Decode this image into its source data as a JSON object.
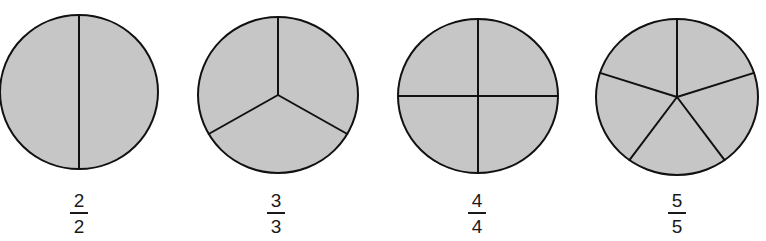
{
  "figure": {
    "colors": {
      "fill": "#c6c6c6",
      "stroke": "#111111",
      "background": "#ffffff"
    },
    "circles": [
      {
        "parts": 2,
        "cx": 79,
        "cy": 92,
        "rx": 79,
        "ry": 77,
        "fraction": {
          "numerator": "2",
          "denominator": "2"
        }
      },
      {
        "parts": 3,
        "cx": 278,
        "cy": 95,
        "rx": 80,
        "ry": 78,
        "fraction": {
          "numerator": "3",
          "denominator": "3"
        }
      },
      {
        "parts": 4,
        "cx": 478,
        "cy": 96,
        "rx": 80,
        "ry": 77,
        "fraction": {
          "numerator": "4",
          "denominator": "4"
        }
      },
      {
        "parts": 5,
        "cx": 677,
        "cy": 97,
        "rx": 81,
        "ry": 78,
        "fraction": {
          "numerator": "5",
          "denominator": "5"
        }
      }
    ]
  }
}
